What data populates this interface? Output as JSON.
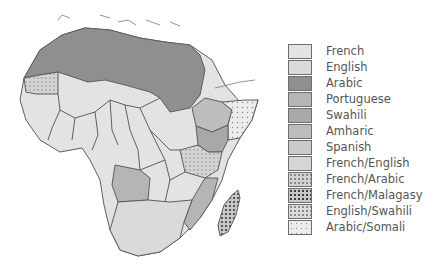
{
  "map": {
    "subject": "Official languages of Africa",
    "regions": {
      "north_africa": "Arabic",
      "western_sahara": "Arabic/Somali",
      "west_africa": "French",
      "central_africa": "French",
      "east_africa_kenya": "Swahili",
      "tanzania": "English/Swahili",
      "ethiopia": "Amharic",
      "somalia": "Arabic/Somali",
      "angola": "Portuguese",
      "mozambique": "Portuguese",
      "madagascar": "French/Malagasy",
      "southern_africa": "English"
    }
  },
  "legend": {
    "items": [
      {
        "label": "French",
        "color": "#e3e3e3",
        "pattern": "solid"
      },
      {
        "label": "English",
        "color": "#dadada",
        "pattern": "solid"
      },
      {
        "label": "Arabic",
        "color": "#8f8f8f",
        "pattern": "solid"
      },
      {
        "label": "Portuguese",
        "color": "#b5b5b5",
        "pattern": "solid"
      },
      {
        "label": "Swahili",
        "color": "#a8a8a8",
        "pattern": "solid"
      },
      {
        "label": "Amharic",
        "color": "#bdbdbd",
        "pattern": "solid"
      },
      {
        "label": "Spanish",
        "color": "#cacaca",
        "pattern": "solid"
      },
      {
        "label": "French/English",
        "color": "#d6d6d6",
        "pattern": "solid"
      },
      {
        "label": "French/Arabic",
        "color": "#d2d2d2",
        "pattern": "dots-light"
      },
      {
        "label": "French/Malagasy",
        "color": "#d0d0d0",
        "pattern": "dots-dark"
      },
      {
        "label": "English/Swahili",
        "color": "#dcdcdc",
        "pattern": "dots-light"
      },
      {
        "label": "Arabic/Somali",
        "color": "#e6e6e6",
        "pattern": "dots-sparse"
      }
    ]
  }
}
